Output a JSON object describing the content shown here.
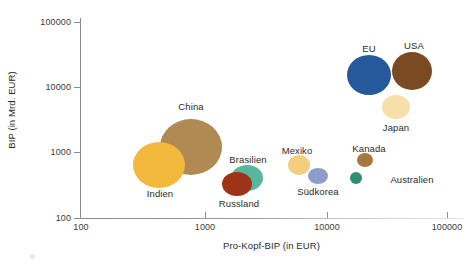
{
  "chart_data": {
    "type": "scatter",
    "title": "",
    "xlabel": "Pro-Kopf-BIP (in EUR)",
    "ylabel": "BIP (in Mrd. EUR)",
    "xscale": "log",
    "yscale": "log",
    "xlim": [
      100,
      100000
    ],
    "ylim": [
      100,
      100000
    ],
    "xticks": [
      "100",
      "1000",
      "10000",
      "100000"
    ],
    "yticks": [
      "100",
      "1000",
      "10000",
      "100000"
    ],
    "grid": false,
    "legend": "none",
    "note": "Bubble area encodes population size",
    "points": [
      {
        "name": "China",
        "x": 1000,
        "y": 1800,
        "color": "#b08a52",
        "px": 191,
        "py": 147,
        "rx": 31,
        "ry": 28,
        "lx": 191,
        "ly": 101
      },
      {
        "name": "Indien",
        "x": 400,
        "y": 700,
        "color": "#f2b93c",
        "px": 159,
        "py": 165,
        "rx": 26,
        "ry": 23,
        "lx": 160,
        "ly": 188
      },
      {
        "name": "EU",
        "x": 21000,
        "y": 12000,
        "color": "#26599c",
        "px": 369,
        "py": 75,
        "rx": 22,
        "ry": 20,
        "lx": 369,
        "ly": 43
      },
      {
        "name": "USA",
        "x": 35000,
        "y": 11500,
        "color": "#7a4a22",
        "px": 412,
        "py": 71,
        "rx": 20,
        "ry": 19,
        "lx": 414,
        "ly": 40
      },
      {
        "name": "Japan",
        "x": 29000,
        "y": 3500,
        "color": "#f6dfa8",
        "px": 396,
        "py": 107,
        "rx": 14,
        "ry": 12,
        "lx": 396,
        "ly": 122
      },
      {
        "name": "Brasilien",
        "x": 1600,
        "y": 550,
        "color": "#57b69c",
        "px": 247,
        "py": 178,
        "rx": 16,
        "ry": 13,
        "lx": 248,
        "ly": 154
      },
      {
        "name": "Russland",
        "x": 1400,
        "y": 450,
        "color": "#9e3318",
        "px": 237,
        "py": 184,
        "rx": 15,
        "ry": 12,
        "lx": 239,
        "ly": 198
      },
      {
        "name": "Mexiko",
        "x": 4400,
        "y": 620,
        "color": "#f5cd7f",
        "px": 299,
        "py": 165,
        "rx": 11,
        "ry": 10,
        "lx": 297,
        "ly": 145
      },
      {
        "name": "Südkorea",
        "x": 7000,
        "y": 480,
        "color": "#8e9ecb",
        "px": 318,
        "py": 176,
        "rx": 10,
        "ry": 8,
        "lx": 318,
        "ly": 186
      },
      {
        "name": "Kanada",
        "x": 24000,
        "y": 600,
        "color": "#a5783f",
        "px": 365,
        "py": 160,
        "rx": 8,
        "ry": 7,
        "lx": 369,
        "ly": 143
      },
      {
        "name": "Australien",
        "x": 21000,
        "y": 480,
        "color": "#2e8f73",
        "px": 356,
        "py": 178,
        "rx": 6,
        "ry": 6,
        "lx": 412,
        "ly": 174
      }
    ]
  },
  "axes": {
    "y": {
      "title": "BIP (in Mrd. EUR)",
      "ticks": [
        {
          "label": "100000",
          "py": 22
        },
        {
          "label": "10000",
          "py": 87
        },
        {
          "label": "1000",
          "py": 152
        },
        {
          "label": "100",
          "py": 218
        }
      ]
    },
    "x": {
      "title": "Pro-Kopf-BIP (in EUR)",
      "ticks": [
        {
          "label": "100",
          "px": 81
        },
        {
          "label": "1000",
          "px": 205
        },
        {
          "label": "10000",
          "px": 327
        },
        {
          "label": "100000",
          "px": 447
        }
      ]
    }
  },
  "colors": {
    "axis": "#8c8c8c",
    "text": "#2b2b2b",
    "background": "#ffffff"
  }
}
